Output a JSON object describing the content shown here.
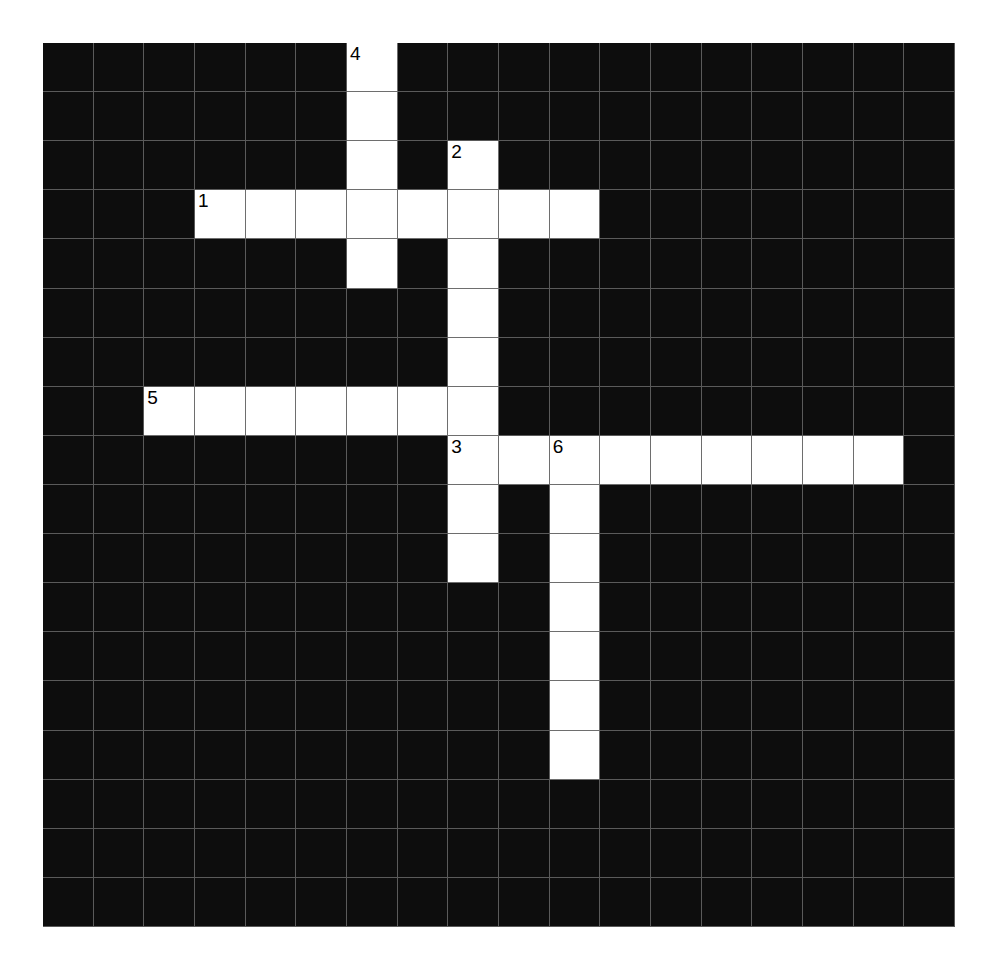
{
  "puzzle": {
    "title": "Crossword Puzzle Grid",
    "grid_columns": 18,
    "grid_rows": 18,
    "cell_size_px": 50.7,
    "colors": {
      "block": "#0d0d0d",
      "open": "#ffffff",
      "gridline": "#5a5a5a",
      "number_text": "#000000",
      "page_background": "#ffffff"
    },
    "entries": [
      {
        "number": "1",
        "direction": "across",
        "row": 3,
        "col": 3,
        "length": 8
      },
      {
        "number": "2",
        "direction": "down",
        "row": 2,
        "col": 8,
        "length": 7
      },
      {
        "number": "3",
        "direction": "across",
        "row": 8,
        "col": 8,
        "length": 9
      },
      {
        "number": "3",
        "direction": "down",
        "row": 8,
        "col": 8,
        "length": 3
      },
      {
        "number": "4",
        "direction": "down",
        "row": 0,
        "col": 6,
        "length": 5
      },
      {
        "number": "5",
        "direction": "across",
        "row": 7,
        "col": 2,
        "length": 7
      },
      {
        "number": "6",
        "direction": "down",
        "row": 8,
        "col": 10,
        "length": 7
      }
    ],
    "numbered_cells": [
      {
        "number": "4",
        "row": 0,
        "col": 6
      },
      {
        "number": "2",
        "row": 2,
        "col": 8
      },
      {
        "number": "1",
        "row": 3,
        "col": 3
      },
      {
        "number": "5",
        "row": 7,
        "col": 2
      },
      {
        "number": "3",
        "row": 8,
        "col": 8
      },
      {
        "number": "6",
        "row": 8,
        "col": 10
      }
    ],
    "open_cells": [
      {
        "row": 0,
        "col": 6
      },
      {
        "row": 1,
        "col": 6
      },
      {
        "row": 2,
        "col": 6
      },
      {
        "row": 2,
        "col": 8
      },
      {
        "row": 3,
        "col": 3
      },
      {
        "row": 3,
        "col": 4
      },
      {
        "row": 3,
        "col": 5
      },
      {
        "row": 3,
        "col": 6
      },
      {
        "row": 3,
        "col": 7
      },
      {
        "row": 3,
        "col": 8
      },
      {
        "row": 3,
        "col": 9
      },
      {
        "row": 3,
        "col": 10
      },
      {
        "row": 4,
        "col": 6
      },
      {
        "row": 4,
        "col": 8
      },
      {
        "row": 5,
        "col": 8
      },
      {
        "row": 6,
        "col": 8
      },
      {
        "row": 7,
        "col": 2
      },
      {
        "row": 7,
        "col": 3
      },
      {
        "row": 7,
        "col": 4
      },
      {
        "row": 7,
        "col": 5
      },
      {
        "row": 7,
        "col": 6
      },
      {
        "row": 7,
        "col": 7
      },
      {
        "row": 7,
        "col": 8
      },
      {
        "row": 8,
        "col": 8
      },
      {
        "row": 8,
        "col": 9
      },
      {
        "row": 8,
        "col": 10
      },
      {
        "row": 8,
        "col": 11
      },
      {
        "row": 8,
        "col": 12
      },
      {
        "row": 8,
        "col": 13
      },
      {
        "row": 8,
        "col": 14
      },
      {
        "row": 8,
        "col": 15
      },
      {
        "row": 8,
        "col": 16
      },
      {
        "row": 9,
        "col": 8
      },
      {
        "row": 9,
        "col": 10
      },
      {
        "row": 10,
        "col": 8
      },
      {
        "row": 10,
        "col": 10
      },
      {
        "row": 11,
        "col": 10
      },
      {
        "row": 12,
        "col": 10
      },
      {
        "row": 13,
        "col": 10
      },
      {
        "row": 14,
        "col": 10
      }
    ]
  }
}
